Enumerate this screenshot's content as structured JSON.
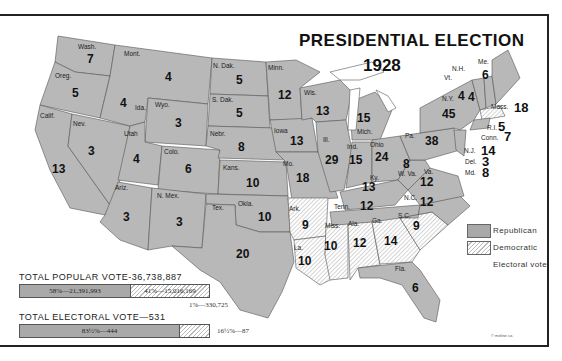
{
  "title": {
    "line1": "PRESIDENTIAL ELECTION",
    "line2": "1928"
  },
  "colors": {
    "republican": "#a9a9a9",
    "democratic_hatch": "#bbbbbb",
    "border": "#222222"
  },
  "states": [
    {
      "abbr": "Wash.",
      "votes": "7",
      "party": "Republican"
    },
    {
      "abbr": "Oreg.",
      "votes": "5",
      "party": "Republican"
    },
    {
      "abbr": "Calif.",
      "votes": "13",
      "party": "Republican"
    },
    {
      "abbr": "Mont.",
      "votes": "4",
      "party": "Republican"
    },
    {
      "abbr": "Ida.",
      "votes": "4",
      "party": "Republican"
    },
    {
      "abbr": "Nev.",
      "votes": "3",
      "party": "Republican"
    },
    {
      "abbr": "Utah",
      "votes": "4",
      "party": "Republican"
    },
    {
      "abbr": "Wyo.",
      "votes": "3",
      "party": "Republican"
    },
    {
      "abbr": "Colo.",
      "votes": "6",
      "party": "Republican"
    },
    {
      "abbr": "Ariz.",
      "votes": "3",
      "party": "Republican"
    },
    {
      "abbr": "N. Mex.",
      "votes": "3",
      "party": "Republican"
    },
    {
      "abbr": "N. Dak.",
      "votes": "5",
      "party": "Republican"
    },
    {
      "abbr": "S. Dak.",
      "votes": "5",
      "party": "Republican"
    },
    {
      "abbr": "Nebr.",
      "votes": "8",
      "party": "Republican"
    },
    {
      "abbr": "Kans.",
      "votes": "10",
      "party": "Republican"
    },
    {
      "abbr": "Okla.",
      "votes": "10",
      "party": "Republican"
    },
    {
      "abbr": "Tex.",
      "votes": "20",
      "party": "Republican"
    },
    {
      "abbr": "Minn.",
      "votes": "12",
      "party": "Republican"
    },
    {
      "abbr": "Iowa",
      "votes": "13",
      "party": "Republican"
    },
    {
      "abbr": "Mo.",
      "votes": "18",
      "party": "Republican"
    },
    {
      "abbr": "Ark.",
      "votes": "9",
      "party": "Democratic"
    },
    {
      "abbr": "La.",
      "votes": "10",
      "party": "Democratic"
    },
    {
      "abbr": "Wis.",
      "votes": "13",
      "party": "Republican"
    },
    {
      "abbr": "Ill.",
      "votes": "29",
      "party": "Republican"
    },
    {
      "abbr": "Mich.",
      "votes": "15",
      "party": "Republican"
    },
    {
      "abbr": "Ind.",
      "votes": "15",
      "party": "Republican"
    },
    {
      "abbr": "Ohio",
      "votes": "24",
      "party": "Republican"
    },
    {
      "abbr": "Ky.",
      "votes": "13",
      "party": "Republican"
    },
    {
      "abbr": "Tenn.",
      "votes": "12",
      "party": "Republican"
    },
    {
      "abbr": "Miss.",
      "votes": "10",
      "party": "Democratic"
    },
    {
      "abbr": "Ala.",
      "votes": "12",
      "party": "Democratic"
    },
    {
      "abbr": "Ga.",
      "votes": "14",
      "party": "Democratic"
    },
    {
      "abbr": "S.C.",
      "votes": "9",
      "party": "Democratic"
    },
    {
      "abbr": "Fla.",
      "votes": "6",
      "party": "Republican"
    },
    {
      "abbr": "N.C.",
      "votes": "12",
      "party": "Republican"
    },
    {
      "abbr": "Va.",
      "votes": "12",
      "party": "Republican"
    },
    {
      "abbr": "W. Va.",
      "votes": "8",
      "party": "Republican"
    },
    {
      "abbr": "Pa.",
      "votes": "38",
      "party": "Republican"
    },
    {
      "abbr": "N.Y.",
      "votes": "45",
      "party": "Republican"
    },
    {
      "abbr": "Vt.",
      "votes": "4",
      "party": "Republican"
    },
    {
      "abbr": "N.H.",
      "votes": "4",
      "party": "Republican"
    },
    {
      "abbr": "Me.",
      "votes": "6",
      "party": "Republican"
    },
    {
      "abbr": "Mass.",
      "votes": "18",
      "party": "Democratic"
    },
    {
      "abbr": "R.I.",
      "votes": "5",
      "party": "Democratic"
    },
    {
      "abbr": "Conn.",
      "votes": "7",
      "party": "Republican"
    },
    {
      "abbr": "N.J.",
      "votes": "14",
      "party": "Republican"
    },
    {
      "abbr": "Del.",
      "votes": "3",
      "party": "Republican"
    },
    {
      "abbr": "Md.",
      "votes": "8",
      "party": "Republican"
    }
  ],
  "legend": {
    "republican": "Republican",
    "democratic": "Democratic",
    "note": "Electoral vote"
  },
  "totals": {
    "popular_heading": "TOTAL POPULAR VOTE-36,738,887",
    "popular_rep": "58%—21,391,993",
    "popular_dem": "41%—15,016,169",
    "popular_other": "1%—330,725",
    "electoral_heading": "TOTAL ELECTORAL VOTE—531",
    "electoral_rep": "83½%—444",
    "electoral_dem": "16½%—87"
  },
  "copyright": "© meline co."
}
